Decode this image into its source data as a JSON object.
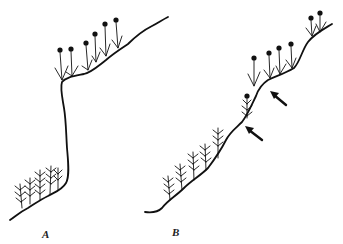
{
  "figure": {
    "panels": [
      {
        "id": "A",
        "label": "A",
        "description": "Moss shoot on cliff ledge: leafy branched gametophytes at base, sporophytes with capsules on upper ledge"
      },
      {
        "id": "B",
        "label": "B",
        "description": "Moss growth along diagonal slope with arrows indicating branching points"
      }
    ],
    "annotations": {
      "arrow_count": 2,
      "capsule_count_A": 6,
      "capsule_count_B": 7
    },
    "colors": {
      "ink": "#111111",
      "paper": "#ffffff"
    }
  }
}
